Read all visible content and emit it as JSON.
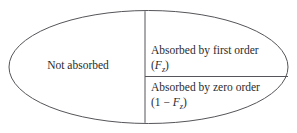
{
  "figure": {
    "type": "venn-like-partition-ellipse",
    "regions": {
      "left": {
        "label": "Not absorbed"
      },
      "right_top": {
        "label": "Absorbed by first order",
        "formula_open": "(",
        "formula_var": "F",
        "formula_sub": "z",
        "formula_close": ")"
      },
      "right_bottom": {
        "label": "Absorbed by zero order",
        "formula_open": "(1 − ",
        "formula_var": "F",
        "formula_sub": "z",
        "formula_close": ")"
      }
    },
    "colors": {
      "stroke": "#55555a",
      "background": "#ffffff",
      "text": "#2b2b2b"
    },
    "geometry": {
      "ellipse_cx": 148.5,
      "ellipse_cy": 67,
      "ellipse_rx": 140,
      "ellipse_ry": 57,
      "vertical_divider_x": 145,
      "horizontal_divider_y": 76.5
    }
  }
}
